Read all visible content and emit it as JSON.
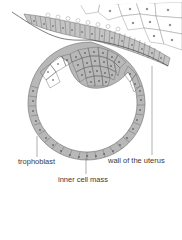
{
  "diagram": {
    "labels": {
      "trophoblast": "trophoblast",
      "wall_of_uterus": "wall of the uterus",
      "inner_cell_mass": "inner cell mass"
    },
    "colors": {
      "cell_fill": "#b8b8b8",
      "cell_outline": "#6a6a6a",
      "nucleus": "#3c3c3c",
      "uterine_stroma_fill": "#ffffff",
      "epithelium_fill": "#c4c4c4",
      "leader_line": "#7a7a7a",
      "text": "#3a3a3a"
    }
  }
}
